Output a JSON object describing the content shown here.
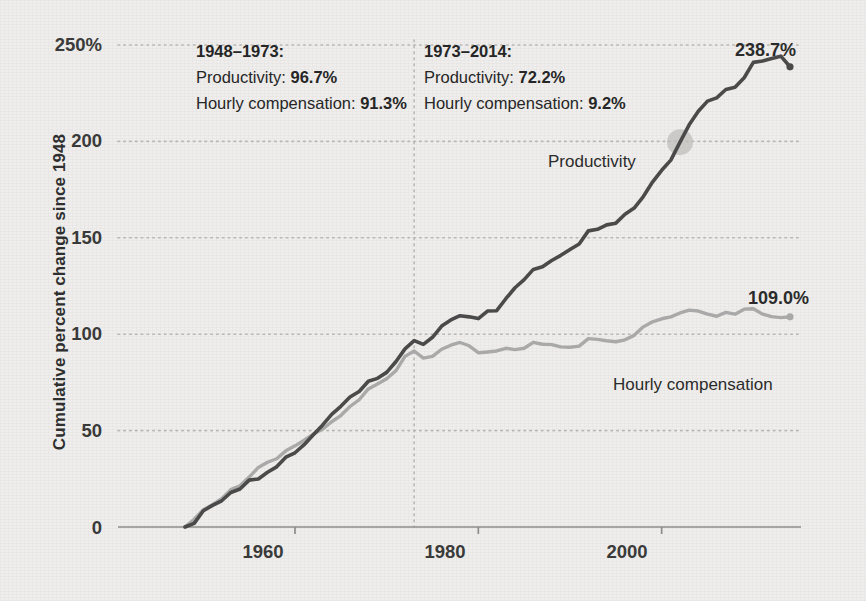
{
  "chart_data": {
    "type": "line",
    "title": "",
    "xlabel": "",
    "ylabel": "Cumulative percent change since 1948",
    "xlim": [
      1947,
      2014
    ],
    "ylim": [
      0,
      260
    ],
    "yticks": [
      "0",
      "50",
      "100",
      "150",
      "200",
      "250%"
    ],
    "ytick_values": [
      0,
      50,
      100,
      150,
      200,
      250
    ],
    "xticks": [
      "1960",
      "1980",
      "2000"
    ],
    "xtick_values": [
      1960,
      1980,
      2000
    ],
    "grid": "horizontal-dotted",
    "legend": "inline-labels",
    "divider_year": 1973,
    "series": [
      {
        "name": "Productivity",
        "color": "#4a4a4a",
        "end_label": "238.7%",
        "end_value": 238.7,
        "x": [
          1948,
          1949,
          1950,
          1951,
          1952,
          1953,
          1954,
          1955,
          1956,
          1957,
          1958,
          1959,
          1960,
          1961,
          1962,
          1963,
          1964,
          1965,
          1966,
          1967,
          1968,
          1969,
          1970,
          1971,
          1972,
          1973,
          1974,
          1975,
          1976,
          1977,
          1978,
          1979,
          1980,
          1981,
          1982,
          1983,
          1984,
          1985,
          1986,
          1987,
          1988,
          1989,
          1990,
          1991,
          1992,
          1993,
          1994,
          1995,
          1996,
          1997,
          1998,
          1999,
          2000,
          2001,
          2002,
          2003,
          2004,
          2005,
          2006,
          2007,
          2008,
          2009,
          2010,
          2011,
          2012,
          2013,
          2014
        ],
        "values": [
          0,
          1.9,
          8.4,
          11.2,
          13.6,
          17.9,
          19.7,
          24.3,
          24.9,
          28.4,
          31.2,
          36.2,
          38.5,
          42.7,
          47.8,
          52.8,
          58.4,
          62.6,
          67.4,
          70.3,
          75.6,
          77.1,
          80.2,
          85.7,
          92.4,
          96.7,
          94.7,
          98.4,
          104.2,
          107.4,
          109.6,
          109.0,
          108.1,
          112.0,
          112.2,
          118.4,
          124.1,
          128.3,
          133.6,
          135.0,
          138.2,
          140.9,
          143.9,
          146.8,
          153.6,
          154.4,
          156.7,
          157.6,
          162.2,
          165.4,
          171.4,
          178.9,
          185.0,
          190.3,
          199.6,
          208.6,
          215.6,
          220.9,
          222.6,
          226.9,
          228.1,
          233.0,
          241.0,
          241.7,
          243.0,
          244.2,
          238.7
        ]
      },
      {
        "name": "Hourly compensation",
        "color": "#a9a9a9",
        "end_label": "109.0%",
        "end_value": 109.0,
        "x": [
          1948,
          1949,
          1950,
          1951,
          1952,
          1953,
          1954,
          1955,
          1956,
          1957,
          1958,
          1959,
          1960,
          1961,
          1962,
          1963,
          1964,
          1965,
          1966,
          1967,
          1968,
          1969,
          1970,
          1971,
          1972,
          1973,
          1974,
          1975,
          1976,
          1977,
          1978,
          1979,
          1980,
          1981,
          1982,
          1983,
          1984,
          1985,
          1986,
          1987,
          1988,
          1989,
          1990,
          1991,
          1992,
          1993,
          1994,
          1995,
          1996,
          1997,
          1998,
          1999,
          2000,
          2001,
          2002,
          2003,
          2004,
          2005,
          2006,
          2007,
          2008,
          2009,
          2010,
          2011,
          2012,
          2013,
          2014
        ],
        "values": [
          0,
          4.0,
          9.0,
          11.6,
          14.7,
          19.4,
          21.4,
          25.9,
          30.9,
          33.6,
          35.4,
          39.5,
          42.1,
          45.0,
          48.2,
          50.7,
          54.6,
          57.8,
          62.5,
          66.0,
          71.6,
          74.2,
          76.9,
          81.0,
          88.5,
          91.3,
          87.6,
          88.5,
          92.2,
          94.3,
          95.7,
          94.0,
          90.4,
          90.8,
          91.3,
          92.7,
          92.0,
          92.7,
          95.8,
          94.8,
          94.6,
          93.4,
          93.2,
          93.8,
          97.7,
          97.3,
          96.6,
          96.1,
          97.1,
          99.4,
          103.8,
          106.4,
          108.0,
          109.0,
          111.0,
          112.5,
          112.0,
          110.4,
          109.3,
          111.3,
          110.4,
          113.0,
          113.2,
          110.4,
          109.1,
          108.6,
          109.0
        ]
      }
    ],
    "annotations": [
      {
        "id": "period-1",
        "period": "1948–1973:",
        "line2_label": "Productivity:",
        "line2_value": "96.7%",
        "line3_label": "Hourly compensation:",
        "line3_value": "91.3%"
      },
      {
        "id": "period-2",
        "period": "1973–2014:",
        "line2_label": "Productivity:",
        "line2_value": "72.2%",
        "line3_label": "Hourly compensation:",
        "line3_value": "9.2%"
      }
    ],
    "highlight_marker": {
      "series": "Productivity",
      "year": 2002
    }
  },
  "colors": {
    "background": "#efeeec",
    "productivity": "#4a4a4a",
    "compensation": "#a9a9a9",
    "gridline": "#b8b7b4",
    "axis": "#8d8c89",
    "text": "#2b2b2b"
  }
}
